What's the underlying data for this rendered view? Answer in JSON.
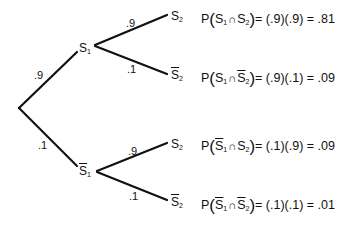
{
  "diagram": {
    "type": "probability-tree",
    "stroke_color": "#111111",
    "root": {
      "x": 19,
      "y": 108
    },
    "first_stage": [
      {
        "id": "S1",
        "label": "S",
        "subscript": "1",
        "complement": false,
        "probability": ".9",
        "end": {
          "x": 77,
          "y": 52
        }
      },
      {
        "id": "notS1",
        "label": "S",
        "subscript": "1",
        "complement": true,
        "probability": ".1",
        "end": {
          "x": 77,
          "y": 166
        }
      }
    ],
    "second_stage": [
      {
        "parent": "S1",
        "label": "S",
        "subscript": "2",
        "complement": false,
        "probability": ".9",
        "equation": {
          "first": "S",
          "first_sub": "1",
          "first_bar": false,
          "second": "S",
          "second_sub": "2",
          "second_bar": false,
          "product": "= (.9)(.9) = .81"
        }
      },
      {
        "parent": "S1",
        "label": "S",
        "subscript": "2",
        "complement": true,
        "probability": ".1",
        "equation": {
          "first": "S",
          "first_sub": "1",
          "first_bar": false,
          "second": "S",
          "second_sub": "2",
          "second_bar": true,
          "product": "= (.9)(.1) = .09"
        }
      },
      {
        "parent": "notS1",
        "label": "S",
        "subscript": "2",
        "complement": false,
        "probability": ".9",
        "equation": {
          "first": "S",
          "first_sub": "1",
          "first_bar": true,
          "second": "S",
          "second_sub": "2",
          "second_bar": false,
          "product": "= (.1)(.9) = .09"
        }
      },
      {
        "parent": "notS1",
        "label": "S",
        "subscript": "2",
        "complement": true,
        "probability": ".1",
        "equation": {
          "first": "S",
          "first_sub": "1",
          "first_bar": true,
          "second": "S",
          "second_sub": "2",
          "second_bar": true,
          "product": "= (.1)(.1) = .01"
        }
      }
    ],
    "text": {
      "p": "P",
      "open": "(",
      "close": ")",
      "cap": "∩"
    }
  }
}
